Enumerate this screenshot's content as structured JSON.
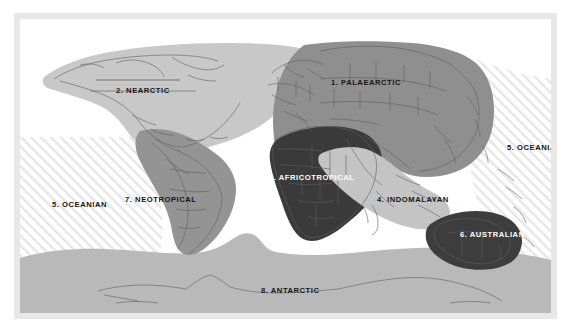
{
  "figure": {
    "kind": "biogeographic-realms-world-map",
    "projection_note": "world map with shaded biogeographic realms"
  },
  "palette": {
    "page_background": "#ffffff",
    "plate_background": "#e8e8e8",
    "canvas_background": "#ffffff",
    "ocean_hatch_line": "#e4e4e4",
    "coastline": "#5a5a5a",
    "country_border": "#6f6f6f",
    "label_dark": "#161616",
    "label_light": "#ffffff",
    "realm_palaearctic": "#8f8f8f",
    "realm_nearctic": "#c8c8c8",
    "realm_africotropical": "#3a3a3a",
    "realm_indomalayan": "#c4c4c4",
    "realm_oceanian": "#ffffff",
    "realm_australian": "#3d3d3d",
    "realm_neotropical": "#949494",
    "realm_antarctic": "#b9b9b9"
  },
  "realms": [
    {
      "number": "1.",
      "name": "PALAEARCTIC",
      "label": "1. PALAEARCTIC",
      "fill": "#8f8f8f",
      "label_color": "dark"
    },
    {
      "number": "2.",
      "name": "NEARCTIC",
      "label": "2. NEARCTIC",
      "fill": "#c8c8c8",
      "label_color": "dark"
    },
    {
      "number": "3.",
      "name": "AFRICOTROPICAL",
      "label": "3. AFRICOTROPICAL",
      "fill": "#3a3a3a",
      "label_color": "light"
    },
    {
      "number": "4.",
      "name": "INDOMALAYAN",
      "label": "4. INDOMALAYAN",
      "fill": "#c4c4c4",
      "label_color": "dark"
    },
    {
      "number": "5.",
      "name": "OCEANIAN",
      "label": "5. OCEANIAN",
      "fill": "#ffffff",
      "label_color": "dark"
    },
    {
      "number": "6.",
      "name": "AUSTRALIAN",
      "label": "6. AUSTRALIAN",
      "fill": "#3d3d3d",
      "label_color": "light"
    },
    {
      "number": "7.",
      "name": "NEOTROPICAL",
      "label": "7. NEOTROPICAL",
      "fill": "#949494",
      "label_color": "dark"
    },
    {
      "number": "8.",
      "name": "ANTARCTIC",
      "label": "8. ANTARCTIC",
      "fill": "#b9b9b9",
      "label_color": "dark"
    }
  ],
  "labels": {
    "palaearctic": "1. PALAEARCTIC",
    "nearctic": "2. NEARCTIC",
    "africotropical": "3. AFRICOTROPICAL",
    "indomalayan": "4. INDOMALAYAN",
    "oceanian_west": "5. OCEANIAN",
    "oceanian_east": "5. OCEANIAN",
    "australian": "6. AUSTRALIAN",
    "neotropical": "7. NEOTROPICAL",
    "antarctic": "8. ANTARCTIC"
  }
}
